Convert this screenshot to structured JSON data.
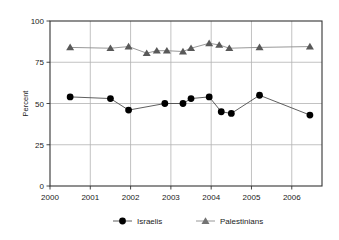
{
  "chart_data": {
    "type": "line",
    "title": "",
    "subtitle": "",
    "xlabel": "",
    "ylabel": "Percent",
    "xlim": [
      2000,
      2006.75
    ],
    "ylim": [
      0,
      100
    ],
    "x_ticks": [
      "2000",
      "2001",
      "2002",
      "2003",
      "2004",
      "2005",
      "2006"
    ],
    "x_tick_values": [
      2000,
      2001,
      2002,
      2003,
      2004,
      2005,
      2006
    ],
    "y_ticks": [
      "0",
      "25",
      "50",
      "75",
      "100"
    ],
    "y_tick_values": [
      0,
      25,
      50,
      75,
      100
    ],
    "grid": "horizontal-and-vertical",
    "legend_position": "bottom",
    "series": [
      {
        "name": "Israelis",
        "marker": "circle",
        "color": "#000000",
        "line_color": "#4d4d4d",
        "points": [
          {
            "x": 2000.5,
            "y": 54
          },
          {
            "x": 2001.5,
            "y": 53
          },
          {
            "x": 2001.95,
            "y": 46
          },
          {
            "x": 2002.85,
            "y": 50
          },
          {
            "x": 2003.3,
            "y": 50
          },
          {
            "x": 2003.5,
            "y": 53
          },
          {
            "x": 2003.95,
            "y": 54
          },
          {
            "x": 2004.25,
            "y": 45
          },
          {
            "x": 2004.5,
            "y": 44
          },
          {
            "x": 2005.2,
            "y": 55
          },
          {
            "x": 2006.45,
            "y": 43
          }
        ]
      },
      {
        "name": "Palestinians",
        "marker": "triangle",
        "color": "#595959",
        "line_color": "#8c8c8c",
        "points": [
          {
            "x": 2000.5,
            "y": 84
          },
          {
            "x": 2001.5,
            "y": 83.5
          },
          {
            "x": 2001.95,
            "y": 84.5
          },
          {
            "x": 2002.4,
            "y": 80.5
          },
          {
            "x": 2002.65,
            "y": 82
          },
          {
            "x": 2002.9,
            "y": 82
          },
          {
            "x": 2003.3,
            "y": 81.5
          },
          {
            "x": 2003.5,
            "y": 83.5
          },
          {
            "x": 2003.95,
            "y": 86.5
          },
          {
            "x": 2004.2,
            "y": 85.5
          },
          {
            "x": 2004.45,
            "y": 83.5
          },
          {
            "x": 2005.2,
            "y": 84
          },
          {
            "x": 2006.45,
            "y": 84.5
          }
        ]
      }
    ]
  },
  "legend": {
    "items": [
      {
        "label": "Israelis",
        "marker": "circle",
        "color": "#000000"
      },
      {
        "label": "Palestinians",
        "marker": "triangle",
        "color": "#737373"
      }
    ]
  },
  "axes": {
    "y_title": "Percent"
  },
  "colors": {
    "frame": "#333333",
    "grid": "#b3b3b3",
    "text": "#1a1a1a",
    "israelis": "#000000",
    "palestinians": "#737373",
    "background": "#ffffff"
  }
}
